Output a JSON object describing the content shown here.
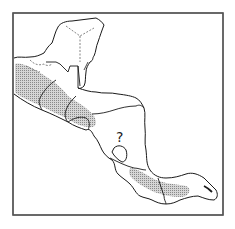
{
  "map": {
    "region": "Central America and southern Mexico",
    "annotation": "?",
    "colors": {
      "frame": "#555555",
      "coastline": "#1a1a1a",
      "border": "#1a1a1a",
      "state_border_dashed": "#666666",
      "range_fill": "#b8b8b8",
      "background": "#ffffff"
    },
    "legend": null
  }
}
